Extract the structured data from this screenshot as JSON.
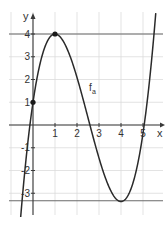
{
  "chart_data": {
    "type": "line",
    "title": "",
    "xlabel": "x",
    "ylabel": "y",
    "xlim": [
      -1,
      5.8
    ],
    "ylim": [
      -4,
      4.8
    ],
    "grid": true,
    "x_ticks": [
      1,
      2,
      3,
      4,
      5
    ],
    "y_ticks": [
      -3,
      -2,
      -1,
      1,
      2,
      3,
      4
    ],
    "x_tick_labels": [
      "1",
      "2",
      "3",
      "4",
      "5"
    ],
    "y_tick_labels": [
      "-3",
      "-2",
      "-1",
      "1",
      "2",
      "3",
      "4"
    ],
    "series": [
      {
        "name": "f_a",
        "label_text": "f",
        "label_subscript": "a",
        "label_position": [
          2.55,
          1.5
        ],
        "description": "cubic with local max at (1,4), local min at (4,-3.33), y-intercept (0,1)",
        "x": [
          -0.5,
          -0.2,
          0,
          0.5,
          1,
          1.5,
          2,
          2.5,
          3,
          3.5,
          4,
          4.5,
          5,
          5.2,
          5.5
        ],
        "y": [
          -3.9,
          -0.8,
          1,
          3.4,
          4,
          3.5,
          2.1,
          0.3,
          -1.5,
          -2.9,
          -3.36,
          -2.6,
          0.1,
          1.4,
          3.9
        ]
      }
    ],
    "reference_lines": [
      {
        "orientation": "horizontal",
        "y": 4,
        "label": "y = 4"
      },
      {
        "orientation": "horizontal",
        "y": -3.33,
        "label": "y = -3.33"
      }
    ],
    "marked_points": [
      {
        "x": 0,
        "y": 1
      },
      {
        "x": 1,
        "y": 4
      }
    ]
  }
}
